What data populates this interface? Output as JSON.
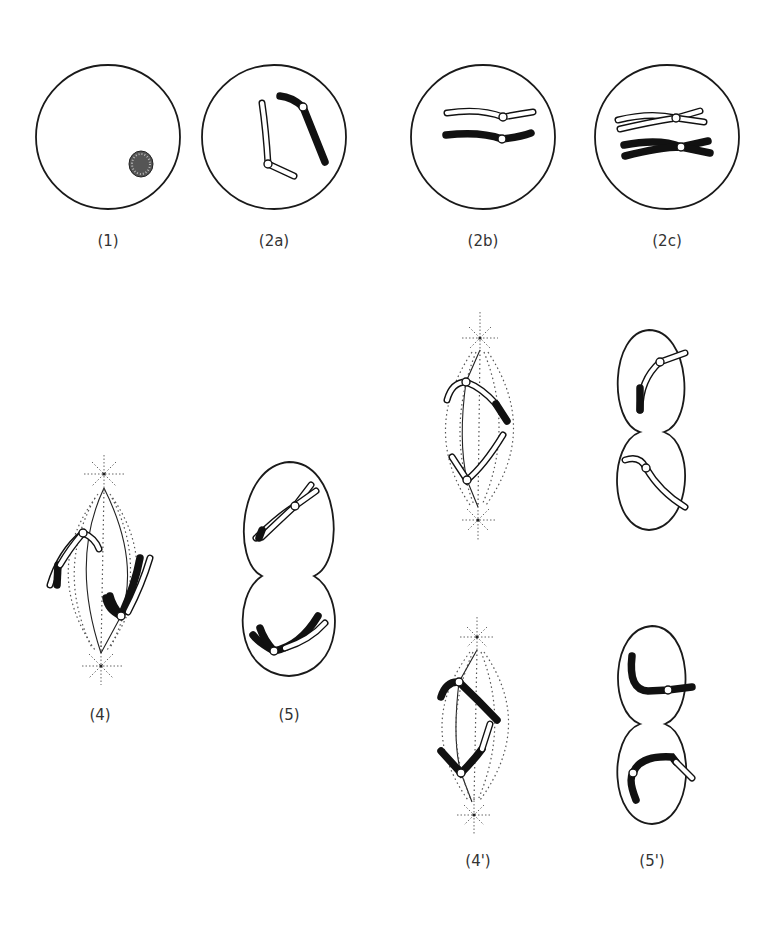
{
  "figure": {
    "panels": [
      {
        "id": "1",
        "label": "(1)",
        "description": "Cell with nucleus"
      },
      {
        "id": "2a",
        "label": "(2a)",
        "description": "Homologous chromosomes, one white one black"
      },
      {
        "id": "2b",
        "label": "(2b)",
        "description": "Homologues aligned (synapsis)"
      },
      {
        "id": "2c",
        "label": "(2c)",
        "description": "Duplicated chromatids with crossing over"
      },
      {
        "id": "4",
        "label": "(4)",
        "description": "Anaphase I with spindle"
      },
      {
        "id": "5",
        "label": "(5)",
        "description": "Telophase I / cytokinesis"
      },
      {
        "id": "4p",
        "label": "(4')",
        "description": "Anaphase II (upper cell)"
      },
      {
        "id": "5p",
        "label": "(5')",
        "description": "Telophase II (upper cell)"
      },
      {
        "id": "4p2",
        "label": "(4')",
        "description": "Anaphase II (lower cell)"
      },
      {
        "id": "5p2",
        "label": "(5')",
        "description": "Telophase II (lower cell)"
      }
    ],
    "colors": {
      "outline": "#1a1a1a",
      "chromosome_dark": "#111111",
      "chromosome_light": "#ffffff",
      "label": "#333333"
    }
  }
}
